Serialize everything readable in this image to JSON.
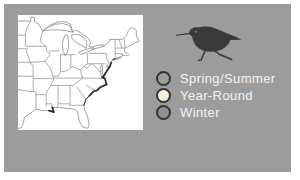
{
  "figure": {
    "background_color": "#9c9c9c",
    "frame_color": "#ffffff"
  },
  "map": {
    "name": "eastern-united-states-outline-map",
    "background_color": "#ffffff",
    "line_color": "#8b8b8b",
    "range_marking_color": "#2e2e2e"
  },
  "bird": {
    "name": "sandpiper-silhouette-icon",
    "color": "#3a3a3a",
    "eye_color": "#6e6e6e"
  },
  "legend": {
    "text_color": "#f4f4f4",
    "marker_ring_color": "#333333",
    "items": [
      {
        "label": "Spring/Summer",
        "marker_color": "#99a196"
      },
      {
        "label": "Year-Round",
        "marker_color": "#f4f1de"
      },
      {
        "label": "Winter",
        "marker_color": "#8e9196"
      }
    ]
  }
}
